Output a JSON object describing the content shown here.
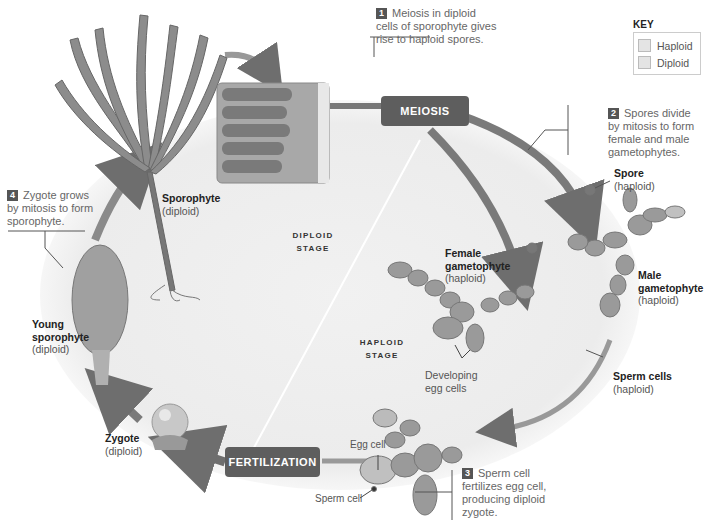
{
  "diagram": {
    "type": "life-cycle",
    "palette": {
      "background": "#ffffff",
      "arrow": "#7a7a7a",
      "phase_box": "#5e5e5e",
      "cycle_fill": "#eeeeee",
      "tissue": "#9a9a9a",
      "text": "#555555",
      "bold_text": "#222222"
    }
  },
  "key": {
    "title": "KEY",
    "items": [
      {
        "label": "Haploid",
        "swatch": "#e4e4e4"
      },
      {
        "label": "Diploid",
        "swatch": "#e4e4e4"
      }
    ]
  },
  "steps": [
    {
      "number": "1",
      "text_lines": [
        "Meiosis in diploid",
        "cells of sporophyte gives",
        "rise to haploid spores."
      ]
    },
    {
      "number": "2",
      "text_lines": [
        "Spores divide",
        "by mitosis to form",
        "female and male",
        "gametophytes."
      ]
    },
    {
      "number": "3",
      "text_lines": [
        "Sperm cell",
        "fertilizes egg cell,",
        "producing diploid",
        "zygote."
      ]
    },
    {
      "number": "4",
      "text_lines": [
        "Zygote grows",
        "by mitosis to form",
        "sporophyte."
      ]
    }
  ],
  "phases": {
    "meiosis": "MEIOSIS",
    "fertilization": "FERTILIZATION"
  },
  "stages": {
    "diploid": [
      "DIPLOID",
      "STAGE"
    ],
    "haploid": [
      "HAPLOID",
      "STAGE"
    ]
  },
  "labels": {
    "sporophyte": {
      "name": "Sporophyte",
      "ploidy": "(diploid)"
    },
    "spore": {
      "name": "Spore",
      "ploidy": "(haploid)"
    },
    "female_gametophyte": {
      "name_lines": [
        "Female",
        "gametophyte"
      ],
      "ploidy": "(haploid)"
    },
    "male_gametophyte": {
      "name_lines": [
        "Male",
        "gametophyte"
      ],
      "ploidy": "(haploid)"
    },
    "developing_egg_cells": [
      "Developing",
      "egg cells"
    ],
    "sperm_cells": {
      "name": "Sperm cells",
      "ploidy": "(haploid)"
    },
    "egg_cell": "Egg cell",
    "sperm_cell": "Sperm cell",
    "zygote": {
      "name": "Zygote",
      "ploidy": "(diploid)"
    },
    "young_sporophyte": {
      "name_lines": [
        "Young",
        "sporophyte"
      ],
      "ploidy": "(diploid)"
    }
  }
}
